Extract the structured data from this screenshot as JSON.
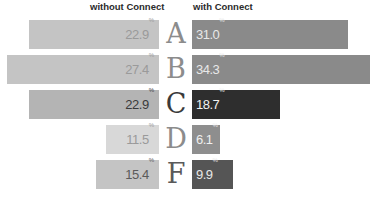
{
  "headers": {
    "left": "without Connect",
    "right": "with Connect"
  },
  "rows": [
    {
      "grade": "A",
      "without": "22.9",
      "with": "31.0",
      "pct": "%",
      "l_left": 29,
      "l_width": 130,
      "r_width": 156,
      "l_bg": "#c4c4c4",
      "l_fg": "#9a9a9a",
      "r_bg": "#8a8a8a",
      "r_fg": "#e8e8e8",
      "g_fg": "#8c8c8c"
    },
    {
      "grade": "B",
      "without": "27.4",
      "with": "34.3",
      "pct": "%",
      "l_left": 7,
      "l_width": 152,
      "r_width": 178,
      "l_bg": "#c4c4c4",
      "l_fg": "#9a9a9a",
      "r_bg": "#8a8a8a",
      "r_fg": "#e8e8e8",
      "g_fg": "#8c8c8c"
    },
    {
      "grade": "C",
      "without": "22.9",
      "with": "18.7",
      "pct": "%",
      "l_left": 29,
      "l_width": 130,
      "r_width": 88,
      "l_bg": "#b4b4b4",
      "l_fg": "#3a3a3a",
      "r_bg": "#2e2e2e",
      "r_fg": "#f2f2f2",
      "g_fg": "#3a3a3a"
    },
    {
      "grade": "D",
      "without": "11.5",
      "with": "6.1",
      "pct": "%",
      "l_left": 106,
      "l_width": 53,
      "r_width": 28,
      "l_bg": "#d8d8d8",
      "l_fg": "#9a9a9a",
      "r_bg": "#8e8e8e",
      "r_fg": "#f0f0f0",
      "g_fg": "#8c8c8c"
    },
    {
      "grade": "F",
      "without": "15.4",
      "with": "9.9",
      "pct": "%",
      "l_left": 96,
      "l_width": 63,
      "r_width": 41,
      "l_bg": "#c4c4c4",
      "l_fg": "#5a5a5a",
      "r_bg": "#555555",
      "r_fg": "#e8e8e8",
      "g_fg": "#5a5a5a"
    }
  ],
  "chart_data": {
    "type": "bar",
    "title": "",
    "orientation": "horizontal-butterfly",
    "categories": [
      "A",
      "B",
      "C",
      "D",
      "F"
    ],
    "series": [
      {
        "name": "without Connect",
        "values": [
          22.9,
          27.4,
          22.9,
          11.5,
          15.4
        ]
      },
      {
        "name": "with Connect",
        "values": [
          31.0,
          34.3,
          18.7,
          6.1,
          9.9
        ]
      }
    ],
    "unit": "%",
    "xlabel": "",
    "ylabel": "Grade",
    "legend": [
      "without Connect",
      "with Connect"
    ],
    "grid": false
  }
}
